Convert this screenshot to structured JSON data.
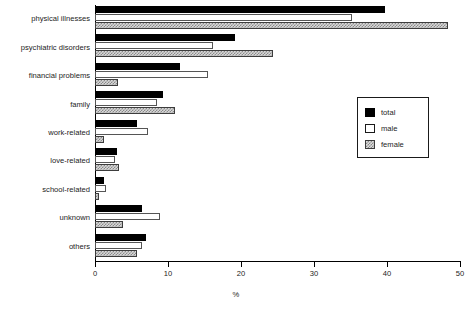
{
  "chart_data": {
    "type": "bar",
    "orientation": "horizontal",
    "title": "",
    "xlabel": "%",
    "ylabel": "",
    "xlim": [
      0,
      50
    ],
    "xticks": [
      0,
      10,
      20,
      30,
      40,
      50
    ],
    "xtick_labels": [
      "0",
      "10",
      "20",
      "30",
      "40",
      "50"
    ],
    "grid": false,
    "legend_position": "center-right",
    "categories": [
      "physical illnesses",
      "psychiatric disorders",
      "financial problems",
      "family",
      "work-related",
      "love-related",
      "school-related",
      "unknown",
      "others"
    ],
    "series": [
      {
        "name": "total",
        "values": [
          39.7,
          19.2,
          11.6,
          9.3,
          5.8,
          3.0,
          1.2,
          6.4,
          7.0
        ]
      },
      {
        "name": "male",
        "values": [
          35.2,
          16.2,
          15.5,
          8.5,
          7.3,
          2.7,
          1.5,
          8.9,
          6.4
        ]
      },
      {
        "name": "female",
        "values": [
          48.4,
          24.4,
          3.2,
          11.0,
          1.2,
          3.3,
          0.5,
          3.8,
          5.8
        ]
      }
    ]
  },
  "legend": {
    "items": [
      {
        "label": "total",
        "swatch": "black-filled-swatch"
      },
      {
        "label": "male",
        "swatch": "white-open-swatch"
      },
      {
        "label": "female",
        "swatch": "hatched-gray-swatch"
      }
    ]
  },
  "axis": {
    "x_title": "%"
  }
}
